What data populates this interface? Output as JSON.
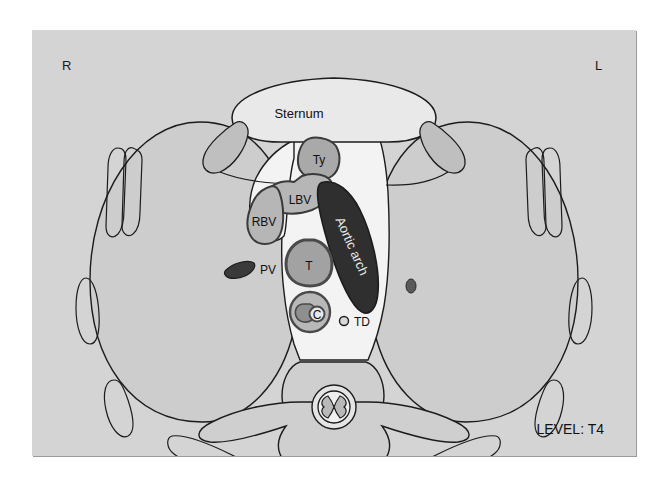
{
  "figure": {
    "level_label": "LEVEL: T4",
    "orientation": {
      "right_marker": "R",
      "left_marker": "L"
    },
    "background_color": "#d4d4d4",
    "panel_border_color": "#9a9a9a"
  },
  "labels": {
    "sternum": "Sternum",
    "thymus": "Ty",
    "left_brachiocephalic_vein": "LBV",
    "right_brachiocephalic_vein": "RBV",
    "aortic_arch": "Aortic arch",
    "trachea": "T",
    "esophagus": "C",
    "thoracic_duct": "TD",
    "pulmonary_vessel": "PV"
  },
  "structures": [
    {
      "name": "sternum",
      "label": "Sternum",
      "kind": "bone",
      "fill": "#e8e8e8",
      "side": "anterior-midline"
    },
    {
      "name": "costal-cartilage-right",
      "label": "",
      "kind": "cartilage",
      "fill": "#c0c0c0",
      "side": "right"
    },
    {
      "name": "costal-cartilage-left",
      "label": "",
      "kind": "cartilage",
      "fill": "#c0c0c0",
      "side": "left"
    },
    {
      "name": "thymus",
      "label": "Ty",
      "kind": "gland",
      "fill": "#a8a8a8",
      "side": "anterior-mediastinum"
    },
    {
      "name": "left-brachiocephalic-vein",
      "label": "LBV",
      "kind": "vein",
      "fill": "#b5b5b5",
      "side": "left"
    },
    {
      "name": "right-brachiocephalic-vein",
      "label": "RBV",
      "kind": "vein",
      "fill": "#b5b5b5",
      "side": "right"
    },
    {
      "name": "aortic-arch",
      "label": "Aortic arch",
      "kind": "artery",
      "fill": "#2e2e2e",
      "side": "midline-left"
    },
    {
      "name": "trachea",
      "label": "T",
      "kind": "airway",
      "fill": "#a0a0a0",
      "side": "midline"
    },
    {
      "name": "esophagus",
      "label": "C",
      "kind": "gi-tract",
      "fill": "#b8b8b8",
      "side": "midline-posterior"
    },
    {
      "name": "thoracic-duct",
      "label": "TD",
      "kind": "lymphatic",
      "fill": "#d4d4d4",
      "side": "midline-posterior"
    },
    {
      "name": "pulmonary-vessel",
      "label": "PV",
      "kind": "vessel",
      "fill": "#3a3a3a",
      "side": "right-lung"
    },
    {
      "name": "lung-right",
      "label": "",
      "kind": "lung",
      "fill": "#cdcdcd",
      "side": "right"
    },
    {
      "name": "lung-left",
      "label": "",
      "kind": "lung",
      "fill": "#cdcdcd",
      "side": "left"
    },
    {
      "name": "vertebral-body",
      "label": "",
      "kind": "bone",
      "fill": "#cfcfcf",
      "side": "posterior-midline"
    },
    {
      "name": "spinal-cord",
      "label": "",
      "kind": "nervous",
      "fill": "#eeeeee",
      "side": "posterior-midline"
    },
    {
      "name": "mediastinum",
      "label": "",
      "kind": "soft-tissue",
      "fill": "#f2f2f2",
      "side": "midline"
    }
  ],
  "rib_count": {
    "right": 4,
    "left": 4
  }
}
